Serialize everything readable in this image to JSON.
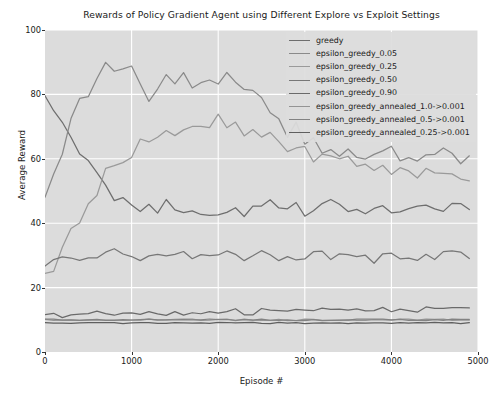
{
  "chart_data": {
    "type": "line",
    "title": "Rewards of Policy Gradient Agent using Different Explore vs Exploit Settings",
    "xlabel": "Episode #",
    "ylabel": "Average Reward",
    "xlim": [
      0,
      5000
    ],
    "ylim": [
      0,
      100
    ],
    "xticks": [
      0,
      1000,
      2000,
      3000,
      4000,
      5000
    ],
    "yticks": [
      0,
      20,
      40,
      60,
      80,
      100
    ],
    "grid": true,
    "grid_color": "#ffffff",
    "plot_background": "#dcdcdc",
    "legend_position": "top-right",
    "x": [
      0,
      100,
      200,
      300,
      400,
      500,
      600,
      700,
      800,
      900,
      1000,
      1100,
      1200,
      1300,
      1400,
      1500,
      1600,
      1700,
      1800,
      1900,
      2000,
      2100,
      2200,
      2300,
      2400,
      2500,
      2600,
      2700,
      2800,
      2900,
      3000,
      3100,
      3200,
      3300,
      3400,
      3500,
      3600,
      3700,
      3800,
      3900,
      4000,
      4100,
      4200,
      4300,
      4400,
      4500,
      4600,
      4700,
      4800,
      4900
    ],
    "series": [
      {
        "name": "greedy",
        "color": "#6e6e6e",
        "values": [
          82,
          74,
          69,
          65,
          62,
          58,
          54,
          51,
          49,
          48,
          47,
          46,
          46,
          45,
          45,
          44,
          45,
          45,
          44,
          44,
          44,
          44,
          44,
          44,
          44,
          44,
          45,
          45,
          45,
          44,
          44,
          45,
          45,
          45,
          45,
          45,
          45,
          45,
          45,
          45,
          44,
          45,
          45,
          45,
          45,
          45,
          45,
          45,
          45,
          45
        ]
      },
      {
        "name": "epsilon_greedy_0.05",
        "color": "#8a8a8a",
        "values": [
          49,
          56,
          64,
          71,
          77,
          82,
          85,
          87,
          88,
          89,
          91,
          84,
          80,
          82,
          83,
          84,
          85,
          85,
          86,
          86,
          86,
          84,
          82,
          80,
          78,
          76,
          74,
          72,
          70,
          68,
          66,
          65,
          64,
          64,
          63,
          63,
          62,
          62,
          61,
          61,
          61,
          60,
          60,
          60,
          60,
          60,
          60,
          60,
          60,
          60
        ]
      },
      {
        "name": "epsilon_greedy_0.25",
        "color": "#9a9a9a",
        "values": [
          23,
          27,
          31,
          36,
          41,
          46,
          51,
          55,
          58,
          60,
          62,
          64,
          65,
          67,
          68,
          69,
          70,
          71,
          71,
          72,
          72,
          71,
          70,
          69,
          68,
          67,
          66,
          65,
          64,
          63,
          62,
          61,
          61,
          60,
          60,
          59,
          59,
          58,
          58,
          57,
          57,
          57,
          56,
          56,
          56,
          55,
          55,
          55,
          55,
          55
        ]
      },
      {
        "name": "epsilon_greedy_0.50",
        "color": "#777777",
        "values": [
          28,
          29,
          30,
          30,
          29,
          28,
          29,
          30,
          31,
          30,
          29,
          29,
          30,
          30,
          29,
          29,
          30,
          30,
          29,
          30,
          30,
          30,
          29,
          29,
          30,
          30,
          29,
          29,
          30,
          30,
          29,
          30,
          30,
          29,
          29,
          30,
          30,
          30,
          29,
          29,
          30,
          30,
          30,
          29,
          30,
          30,
          30,
          30,
          30,
          30
        ]
      },
      {
        "name": "epsilon_greedy_0.90",
        "color": "#6a6a6a",
        "values": [
          11,
          12,
          11,
          12,
          12,
          12,
          12,
          12,
          12,
          12,
          12,
          12,
          12,
          12,
          12,
          12,
          12,
          12,
          12,
          12,
          12,
          13,
          13,
          12,
          12,
          13,
          13,
          13,
          12,
          13,
          13,
          13,
          13,
          13,
          13,
          13,
          13,
          13,
          13,
          14,
          13,
          13,
          13,
          13,
          14,
          13,
          13,
          14,
          14,
          14
        ]
      },
      {
        "name": "epsilon_greedy_annealed_1.0->0.001",
        "color": "#949494",
        "values": [
          10,
          10,
          10,
          10,
          10,
          10,
          10,
          10,
          10,
          10,
          10,
          10,
          10,
          10,
          10,
          10,
          10,
          10,
          10,
          10,
          10,
          10,
          10,
          10,
          10,
          10,
          10,
          10,
          10,
          10,
          10,
          10,
          10,
          10,
          10,
          10,
          10,
          10,
          10,
          10,
          10,
          10,
          10,
          10,
          10,
          10,
          10,
          10,
          10,
          10
        ]
      },
      {
        "name": "epsilon_greedy_annealed_0.5->0.001",
        "color": "#828282",
        "values": [
          10,
          10,
          10,
          10,
          10,
          10,
          10,
          10,
          10,
          10,
          10,
          10,
          10,
          10,
          10,
          10,
          10,
          10,
          10,
          10,
          10,
          10,
          10,
          10,
          10,
          10,
          10,
          10,
          10,
          10,
          10,
          10,
          10,
          10,
          10,
          10,
          10,
          10,
          10,
          10,
          10,
          10,
          10,
          10,
          10,
          10,
          10,
          10,
          10,
          10
        ]
      },
      {
        "name": "epsilon_greedy_annealed_0.25->0.001",
        "color": "#5f5f5f",
        "values": [
          9,
          9,
          9,
          9,
          9,
          9,
          9,
          9,
          9,
          9,
          9,
          9,
          9,
          9,
          9,
          9,
          9,
          9,
          9,
          9,
          9,
          9,
          9,
          9,
          9,
          9,
          9,
          9,
          9,
          9,
          9,
          9,
          9,
          9,
          9,
          9,
          9,
          9,
          9,
          9,
          9,
          9,
          9,
          9,
          9,
          9,
          9,
          9,
          9,
          9
        ]
      }
    ]
  }
}
